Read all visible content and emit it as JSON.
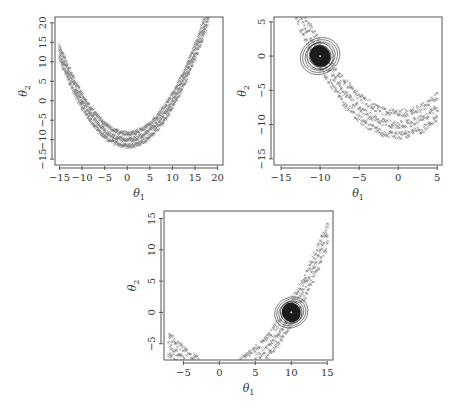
{
  "chart_data": [
    {
      "id": "panel-a",
      "type": "scatter",
      "title": "",
      "xlabel": "θ1",
      "ylabel": "θ2",
      "xlim": [
        -16,
        21.2
      ],
      "ylim": [
        -16.5,
        21.5
      ],
      "xticks": [
        -15,
        -10,
        -5,
        0,
        5,
        10,
        15,
        20
      ],
      "yticks": [
        -15,
        -10,
        -5,
        0,
        5,
        10,
        15,
        20
      ],
      "grid": false,
      "description": "Banana-shaped band of particle samples (x marks) following theta2 ≈ 0.1*theta1^2 - 10",
      "series": [
        {
          "name": "particles",
          "curve": "parabola",
          "a": 0.1,
          "vertex": [
            0,
            -10
          ],
          "x_range": [
            -15,
            18
          ],
          "band_width": 4
        }
      ],
      "frame": {
        "x0": 55,
        "y0": 17,
        "x1": 223,
        "y1": 165
      }
    },
    {
      "id": "panel-b",
      "type": "scatter",
      "title": "",
      "xlabel": "θ1",
      "ylabel": "θ2",
      "xlim": [
        -15.9,
        5.6
      ],
      "ylim": [
        -15.9,
        5.7
      ],
      "xticks": [
        -15,
        -10,
        -5,
        0,
        5
      ],
      "yticks": [
        -15,
        -10,
        -5,
        0,
        5
      ],
      "grid": false,
      "description": "Particle band along parabola with dense contour mode centered at (-10, 0)",
      "series": [
        {
          "name": "particles",
          "curve": "parabola",
          "a": 0.1,
          "vertex": [
            0,
            -10
          ],
          "x_range": [
            -13,
            5
          ],
          "band_width": 4
        },
        {
          "name": "contour-mode",
          "type": "contour",
          "center": [
            -10,
            0
          ],
          "radii": [
            2.6,
            2.3,
            2.0,
            1.7,
            1.4,
            1.1,
            0.8,
            0.5
          ]
        }
      ],
      "frame": {
        "x0": 274,
        "y0": 17,
        "x1": 442,
        "y1": 165
      }
    },
    {
      "id": "panel-c",
      "type": "scatter",
      "title": "",
      "xlabel": "θ1",
      "ylabel": "θ2",
      "xlim": [
        -7.7,
        15.8
      ],
      "ylim": [
        -7.6,
        16.2
      ],
      "xticks": [
        -5,
        0,
        5,
        10,
        15
      ],
      "yticks": [
        -5,
        0,
        5,
        10,
        15
      ],
      "grid": false,
      "description": "Particle band along parabola with dense contour mode centered at (10, 0)",
      "series": [
        {
          "name": "particles",
          "curve": "parabola",
          "a": 0.1,
          "vertex": [
            0,
            -10
          ],
          "x_range": [
            3,
            15
          ],
          "band_width": 4
        },
        {
          "name": "particles-left",
          "curve": "parabola",
          "a": 0.1,
          "vertex": [
            0,
            -10
          ],
          "x_range": [
            -7,
            -3
          ],
          "band_width": 4
        },
        {
          "name": "contour-mode",
          "type": "contour",
          "center": [
            10,
            0
          ],
          "radii": [
            2.4,
            2.1,
            1.8,
            1.5,
            1.2,
            0.9,
            0.6,
            0.3
          ]
        }
      ],
      "frame": {
        "x0": 164,
        "y0": 211,
        "x1": 333,
        "y1": 360
      }
    }
  ],
  "labels": {
    "theta": "θ",
    "sub1": "1",
    "sub2": "2"
  }
}
